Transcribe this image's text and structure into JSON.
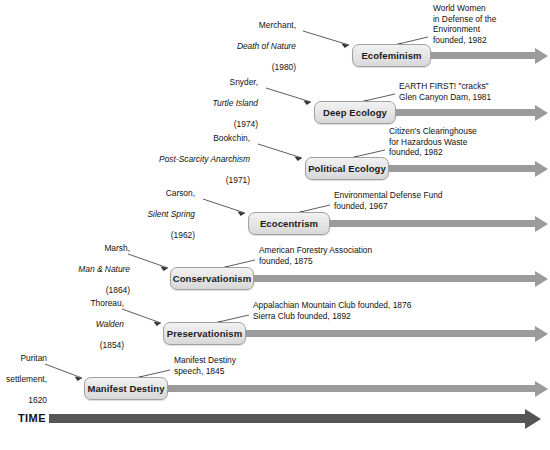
{
  "figure": {
    "type": "timeline-diagram"
  },
  "time_axis": {
    "label": "TIME",
    "direction": "left-to-right",
    "arrow_color": "#555555"
  },
  "palette": {
    "box_fill_top": "#f2f2f2",
    "box_fill_bottom": "#d8d8d8",
    "box_border": "#a0a0a0",
    "row_arrow": "#9b9b9b",
    "time_arrow": "#555555",
    "text": "#111111",
    "background": "#ffffff"
  },
  "rows": [
    {
      "id": "ecofeminism",
      "movement": "Ecofeminism",
      "left_note": {
        "author": "Merchant,",
        "work": "Death of Nature",
        "year": "(1980)"
      },
      "right_note": "World Women\nin Defense of the\nEnvironment\nfounded, 1982"
    },
    {
      "id": "deep-ecology",
      "movement": "Deep Ecology",
      "left_note": {
        "author": "Snyder,",
        "work": "Turtle Island",
        "year": "(1974)"
      },
      "right_note": "EARTH FIRST! \"cracks\"\nGlen Canyon Dam, 1981"
    },
    {
      "id": "political-ecology",
      "movement": "Political Ecology",
      "left_note": {
        "author": "Bookchin,",
        "work": "Post-Scarcity Anarchism",
        "year": "(1971)"
      },
      "right_note": "Citizen's Clearinghouse\nfor Hazardous Waste\nfounded, 1982"
    },
    {
      "id": "ecocentrism",
      "movement": "Ecocentrism",
      "left_note": {
        "author": "Carson,",
        "work": "Silent Spring",
        "year": "(1962)"
      },
      "right_note": "Environmental Defense Fund\nfounded, 1967"
    },
    {
      "id": "conservationism",
      "movement": "Conservationism",
      "left_note": {
        "author": "Marsh,",
        "work": "Man & Nature",
        "year": "(1864)"
      },
      "right_note": "American Forestry Association\nfounded, 1875"
    },
    {
      "id": "preservationism",
      "movement": "Preservationism",
      "left_note": {
        "author": "Thoreau,",
        "work": "Walden",
        "year": "(1854)"
      },
      "right_note": "Appalachian Mountain Club founded, 1876\nSierra Club founded, 1892"
    },
    {
      "id": "manifest-destiny",
      "movement": "Manifest Destiny",
      "left_note": {
        "author": "Puritan",
        "work": "settlement,",
        "year": "1620"
      },
      "right_note": "Manifest Destiny\nspeech, 1845"
    }
  ]
}
